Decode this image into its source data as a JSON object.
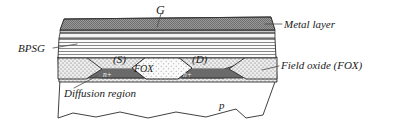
{
  "figure": {
    "type": "semiconductor-cross-section-diagram"
  },
  "labels": {
    "gate": "G",
    "metal_layer": "Metal layer",
    "bpsg": "BPSG",
    "field_oxide": "Field oxide (FOX)",
    "source": "(S)",
    "drain": "(D)",
    "fox_block": "FOX",
    "nplus_left": "n+",
    "nplus_right": "n+",
    "diffusion_region": "Diffusion region",
    "substrate": "p"
  },
  "colors": {
    "metal_layer": "#8c8c8c",
    "bpsg": "#f2f2f2",
    "field_oxide": "#e6e6e6",
    "nplus": "#707070",
    "fox_block": "#f5f5f5",
    "substrate": "#ffffff",
    "outline": "#2b2b2b",
    "leader": "#4a4a4a",
    "text": "#1a1a1a"
  },
  "layers": [
    {
      "name": "metal-layer",
      "label": "Metal layer",
      "fill": "dark-gray-dotted"
    },
    {
      "name": "bpsg-layer",
      "label": "BPSG",
      "fill": "horizontal-lines"
    },
    {
      "name": "field-oxide-layer",
      "label": "Field oxide (FOX)",
      "fill": "stipple-dots"
    },
    {
      "name": "nplus-region",
      "label": "n+",
      "fill": "dark-gray"
    },
    {
      "name": "substrate",
      "label": "p",
      "fill": "white"
    }
  ],
  "leader_lines": [
    {
      "name": "gate-leader",
      "from": "G",
      "to": "metal-layer"
    },
    {
      "name": "metal-leader",
      "from": "Metal layer",
      "to": "metal-layer"
    },
    {
      "name": "bpsg-leader",
      "from": "BPSG",
      "to": "bpsg-layer"
    },
    {
      "name": "fox-leader",
      "from": "Field oxide (FOX)",
      "to": "field-oxide-layer"
    },
    {
      "name": "diffusion-leader",
      "from": "Diffusion region",
      "to": "nplus-region"
    }
  ]
}
